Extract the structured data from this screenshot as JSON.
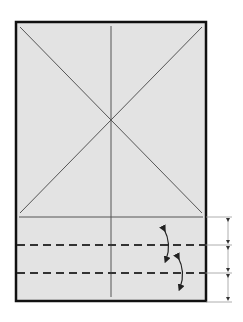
{
  "diagram": {
    "type": "origami-fold-diagram",
    "paper": {
      "fill": "#e3e3e3",
      "border": "#111111",
      "x": 15,
      "y": 21,
      "width": 192,
      "height": 281
    },
    "crease_color": "#555555",
    "valley_fold_color": "#333333",
    "dimension_color": "#888888",
    "center_point": {
      "x": 111,
      "y": 120
    },
    "horizontal_crease_y": 217,
    "valley_folds_y": [
      245,
      273
    ],
    "dimension_marks_y": [
      217,
      245,
      273,
      302
    ],
    "dimension_x": 228,
    "fold_arrows": [
      {
        "label": "fold-up-arrow-1",
        "from_y": 228,
        "to_y": 260
      },
      {
        "label": "fold-up-arrow-2",
        "from_y": 256,
        "to_y": 288
      }
    ],
    "segments": [
      "equal",
      "equal",
      "equal"
    ]
  }
}
